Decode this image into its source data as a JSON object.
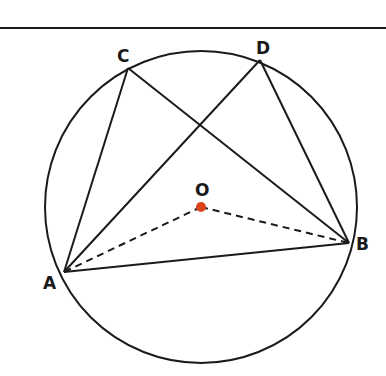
{
  "diagram": {
    "type": "circle-geometry",
    "top_rule": {
      "x1": 0,
      "y1": 28,
      "x2": 386,
      "y2": 28
    },
    "circle": {
      "cx": 201,
      "cy": 207,
      "r": 156
    },
    "center": {
      "label": "O",
      "x": 201,
      "y": 207,
      "dot_color": "#d9441c"
    },
    "points": {
      "A": {
        "label": "A",
        "x": 64,
        "y": 272
      },
      "B": {
        "label": "B",
        "x": 349,
        "y": 243
      },
      "C": {
        "label": "C",
        "x": 128,
        "y": 68
      },
      "D": {
        "label": "D",
        "x": 260,
        "y": 60
      }
    },
    "solid_segments": [
      "AC",
      "CB",
      "AD",
      "DB",
      "AB"
    ],
    "dashed_segments": [
      "OA",
      "OB"
    ],
    "stroke_color": "#1a1a1a"
  }
}
